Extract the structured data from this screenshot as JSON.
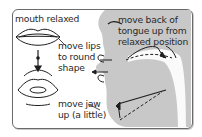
{
  "diagram": {
    "labels": {
      "mouth_relaxed": "mouth relaxed",
      "move_lips_line1": "move lips",
      "move_lips_line2": "to round",
      "move_lips_line3": "shape",
      "move_jaw_line1": "move jaw",
      "move_jaw_line2": "up (a little)",
      "tongue_line1": "move back of",
      "tongue_line2": "tongue up from",
      "tongue_line3": "relaxed position"
    },
    "colors": {
      "face": "#c8c8c8",
      "line": "#1e1e1e",
      "border": "#6a6a6a",
      "text": "#2a2a2a"
    }
  }
}
